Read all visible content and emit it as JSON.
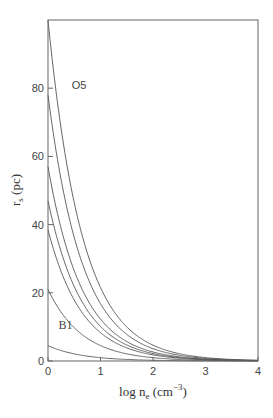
{
  "chart_data": {
    "type": "line",
    "title": "",
    "xlabel": "log n_e (cm^-3)",
    "ylabel": "r_s (pc)",
    "xlim": [
      0,
      4
    ],
    "ylim": [
      0,
      100
    ],
    "xticks": [
      0,
      1,
      2,
      3,
      4
    ],
    "yticks": [
      0,
      20,
      40,
      60,
      80
    ],
    "grid": false,
    "legend": null,
    "relation": "r = r0 * 10^(-2x/3)",
    "series": [
      {
        "name": "O5",
        "r0": 100
      },
      {
        "name": "",
        "r0": 78
      },
      {
        "name": "",
        "r0": 57
      },
      {
        "name": "",
        "r0": 47
      },
      {
        "name": "",
        "r0": 38.5
      },
      {
        "name": "",
        "r0": 21
      },
      {
        "name": "B1",
        "r0": 4.5
      }
    ],
    "annotations": [
      {
        "text": "O5",
        "x": 0.45,
        "y": 81
      },
      {
        "text": "B1",
        "x": 0.2,
        "y": 10.5
      }
    ]
  },
  "labels": {
    "x_main": "log n",
    "x_sub": "e",
    "x_unit_open": " (cm",
    "x_sup": "−3",
    "x_unit_close": ")",
    "y_main": "r",
    "y_sub": "s",
    "y_unit": " (pc)"
  },
  "colors": {
    "curve": "#555555",
    "axis": "#666666"
  }
}
